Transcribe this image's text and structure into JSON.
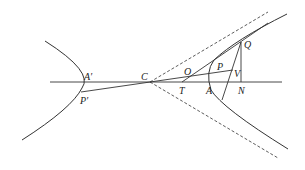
{
  "diagram": {
    "type": "hyperbola-geometry",
    "labels": {
      "A_prime": "A′",
      "P_prime": "P′",
      "C": "C",
      "O": "O",
      "T": "T",
      "P": "P",
      "A": "A",
      "V": "V",
      "N": "N",
      "Q": "Q"
    },
    "colors": {
      "stroke": "#333333",
      "background": "#ffffff"
    }
  }
}
